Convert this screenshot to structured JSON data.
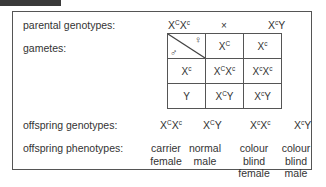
{
  "labels": {
    "parental": "parental genotypes:",
    "gametes": "gametes:",
    "offspring_genotypes": "offspring genotypes:",
    "offspring_phenotypes": "offspring phenotypes:"
  },
  "parents": {
    "mother": {
      "a_base": "X",
      "a_sup": "C",
      "b_base": "X",
      "b_sup": "c"
    },
    "cross_symbol": "×",
    "father": {
      "a_base": "X",
      "a_sup": "c",
      "b_base": "Y"
    }
  },
  "punnett": {
    "female_symbol": "♀",
    "male_symbol": "♂",
    "female_gametes": [
      {
        "base": "X",
        "sup": "C"
      },
      {
        "base": "X",
        "sup": "c"
      }
    ],
    "male_gametes": [
      {
        "base": "X",
        "sup": "c"
      },
      {
        "base": "Y",
        "sup": ""
      }
    ],
    "cells": [
      [
        {
          "a": "X",
          "as": "C",
          "b": "X",
          "bs": "c"
        },
        {
          "a": "X",
          "as": "c",
          "b": "X",
          "bs": "c"
        }
      ],
      [
        {
          "a": "X",
          "as": "C",
          "b": "Y",
          "bs": ""
        },
        {
          "a": "X",
          "as": "c",
          "b": "Y",
          "bs": ""
        }
      ]
    ]
  },
  "offspring": [
    {
      "a": "X",
      "as": "C",
      "b": "X",
      "bs": "c",
      "phenotype": [
        "carrier",
        "female"
      ]
    },
    {
      "a": "X",
      "as": "C",
      "b": "Y",
      "bs": "",
      "phenotype": [
        "normal",
        "male"
      ]
    },
    {
      "a": "X",
      "as": "c",
      "b": "X",
      "bs": "c",
      "phenotype": [
        "colour",
        "blind",
        "female"
      ]
    },
    {
      "a": "X",
      "as": "c",
      "b": "Y",
      "bs": "",
      "phenotype": [
        "colour",
        "blind",
        "male"
      ]
    }
  ]
}
